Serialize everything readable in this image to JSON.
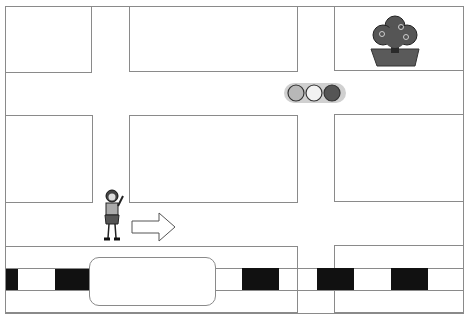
{
  "map": {
    "title": "",
    "labels": {
      "top_left_block": "",
      "top_center_block": "",
      "top_right_block": "",
      "middle_left_block": "",
      "middle_center_block": "",
      "middle_right_block": "",
      "rounded_box": ""
    },
    "icons": {
      "tree": "tree-in-planter-icon",
      "traffic_light": "traffic-light-icon",
      "person": "person-icon",
      "arrow": "arrow-right-icon"
    },
    "traffic_light_colors": [
      "#b8b8b8",
      "#f2f2f2",
      "#555555"
    ],
    "colors": {
      "line": "#8a8a8a",
      "crosswalk": "#111111",
      "tree": "#555555"
    }
  }
}
